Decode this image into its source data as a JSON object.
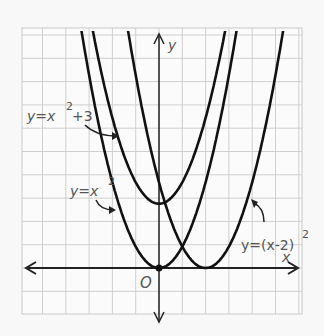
{
  "chart_data": {
    "type": "line",
    "title": "",
    "xlabel": "x",
    "ylabel": "y",
    "origin_label": "O",
    "grid": true,
    "grid_cells": {
      "x": [
        -6,
        6
      ],
      "y": [
        -2,
        10.5
      ]
    },
    "series": [
      {
        "name": "y=x^2+3",
        "label_main": "y=x",
        "label_sup": "2",
        "label_tail": "+3",
        "equation": "x^2+3",
        "vertex": [
          0,
          3
        ],
        "h": 0,
        "k": 3
      },
      {
        "name": "y=x^2",
        "label_main": "y=x",
        "label_sup": "2",
        "label_tail": "",
        "equation": "x^2",
        "vertex": [
          0,
          0
        ],
        "h": 0,
        "k": 0
      },
      {
        "name": "y=(x-2)^2",
        "label_main": "y=(x-2)",
        "label_sup": "2",
        "label_tail": "",
        "equation": "(x-2)^2",
        "vertex": [
          2,
          0
        ],
        "h": 2,
        "k": 0
      }
    ],
    "points": [
      {
        "label": "origin",
        "x": 0,
        "y": 0
      }
    ]
  },
  "labels": {
    "x_axis": "x",
    "y_axis": "y",
    "origin": "O",
    "curve1_main": "y=x",
    "curve1_sup": "2",
    "curve1_tail": "+3",
    "curve2_main": "y=x",
    "curve2_sup": "2",
    "curve3_main": "y=(x-2)",
    "curve3_sup": "2"
  }
}
